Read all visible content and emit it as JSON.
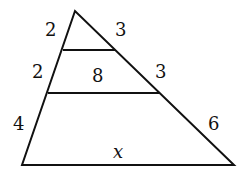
{
  "diagram": {
    "type": "triangle-with-parallel-segments",
    "points": {
      "apex": [
        75,
        11
      ],
      "bottom_left": [
        22,
        165
      ],
      "bottom_right": [
        234,
        165
      ],
      "seg1_left": [
        63,
        50
      ],
      "seg1_right": [
        115,
        50
      ],
      "seg2_left": [
        48,
        93
      ],
      "seg2_right": [
        159,
        93
      ]
    },
    "labels": {
      "left_top": "2",
      "left_middle": "2",
      "left_bottom": "4",
      "right_top": "3",
      "right_middle": "3",
      "right_bottom": "6",
      "middle_segment": "8",
      "base": "x"
    },
    "stroke_color": "#111111"
  }
}
